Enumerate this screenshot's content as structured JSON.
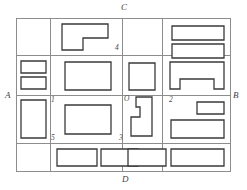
{
  "figure": {
    "title": "",
    "type": "floor-plan-diagram",
    "background_color": "#ffffff",
    "grid_color": "#8d8d8d",
    "shape_stroke_color": "#3a3a3a"
  },
  "boundary_labels": [
    {
      "id": "label-C",
      "text": "C",
      "x": 121,
      "y": 3,
      "position": "top"
    },
    {
      "id": "label-A",
      "text": "A",
      "x": 5,
      "y": 91,
      "position": "left"
    },
    {
      "id": "label-B",
      "text": "B",
      "x": 233,
      "y": 91,
      "position": "right"
    },
    {
      "id": "label-D",
      "text": "D",
      "x": 122,
      "y": 175,
      "position": "bottom"
    }
  ],
  "cell_labels": [
    {
      "id": "label-4",
      "text": "4",
      "x": 115,
      "y": 44
    },
    {
      "id": "label-1",
      "text": "1",
      "x": 51,
      "y": 96
    },
    {
      "id": "label-O",
      "text": "O",
      "x": 124,
      "y": 95
    },
    {
      "id": "label-2",
      "text": "2",
      "x": 169,
      "y": 96
    },
    {
      "id": "label-5",
      "text": "5",
      "x": 51,
      "y": 134
    },
    {
      "id": "label-3",
      "text": "3",
      "x": 119,
      "y": 134
    }
  ],
  "grid": {
    "frame": {
      "x": 16,
      "y": 18,
      "width": 215,
      "height": 154
    },
    "vertical_lines_x": [
      50,
      122,
      162
    ],
    "horizontal_lines_y": [
      74,
      96,
      143
    ]
  },
  "shapes": [
    {
      "id": "shape-r1c2-L",
      "kind": "L-shape",
      "points": "62,24 108,24 108,38 83,38 83,50 62,50"
    },
    {
      "id": "shape-r1c4-top",
      "kind": "rectangle",
      "points": "172,26 224,26 224,40 172,40"
    },
    {
      "id": "shape-r1c4-bottom",
      "kind": "rectangle",
      "points": "172,44 224,44 224,58 172,58"
    },
    {
      "id": "shape-r2c1-top",
      "kind": "rectangle",
      "points": "21,61 46,61 46,73 21,73"
    },
    {
      "id": "shape-r2c1-bottom",
      "kind": "rectangle",
      "points": "21,77 46,77 46,89 21,89"
    },
    {
      "id": "shape-r2c2",
      "kind": "rectangle",
      "points": "65,62 111,62 111,90 65,90"
    },
    {
      "id": "shape-r2c3",
      "kind": "rectangle",
      "points": "129,63 155,63 155,90 129,90"
    },
    {
      "id": "shape-r2c4-notched",
      "kind": "notched-rectangle",
      "points": "170,62 224,62 224,89 214,89 214,79 180,79 180,89 170,89"
    },
    {
      "id": "shape-r3c1",
      "kind": "rectangle",
      "points": "21,100 46,100 46,138 21,138"
    },
    {
      "id": "shape-r3c2",
      "kind": "rectangle",
      "points": "65,105 111,105 111,134 65,134"
    },
    {
      "id": "shape-r3c3-notched",
      "kind": "notched-rectangle",
      "points": "136,97 152,97 152,136 131,136 131,117 140,117 140,107 136,107"
    },
    {
      "id": "shape-r3c4-small",
      "kind": "rectangle",
      "points": "197,102 224,102 224,114 197,114"
    },
    {
      "id": "shape-r3c4-large",
      "kind": "rectangle",
      "points": "171,120 224,120 224,138 171,138"
    },
    {
      "id": "shape-r4c2-left",
      "kind": "rectangle",
      "points": "57,149 97,149 97,166 57,166"
    },
    {
      "id": "shape-r4c2-right",
      "kind": "rectangle",
      "points": "101,149 138,149 138,166 101,166"
    },
    {
      "id": "shape-r4c3",
      "kind": "rectangle",
      "points": "128,149 166,149 166,166 128,166"
    },
    {
      "id": "shape-r4c4",
      "kind": "rectangle",
      "points": "171,149 224,149 224,166 171,166"
    }
  ]
}
